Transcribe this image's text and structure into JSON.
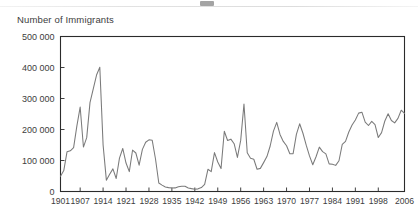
{
  "decoration": {
    "top_rule": "horizontal-rule",
    "top_glyph": "cropped-title-fragment"
  },
  "chart_data": {
    "type": "line",
    "title": "",
    "subtitle": "",
    "ylabel": "Number of Immigrants",
    "xlabel": "",
    "ylim": [
      0,
      500000
    ],
    "xlim": [
      1901,
      2006
    ],
    "grid": false,
    "legend": null,
    "y_ticks": [
      0,
      100000,
      200000,
      300000,
      400000,
      500000
    ],
    "y_tick_labels": [
      "0",
      "100 000",
      "200 000",
      "300 000",
      "400 000",
      "500 000"
    ],
    "x_ticks": [
      1901,
      1907,
      1914,
      1921,
      1928,
      1935,
      1942,
      1949,
      1956,
      1963,
      1970,
      1977,
      1984,
      1991,
      1998,
      2006
    ],
    "x_tick_labels": [
      "1901",
      "1907",
      "1914",
      "1921",
      "1928",
      "1935",
      "1942",
      "1949",
      "1956",
      "1963",
      "1970",
      "1977",
      "1984",
      "1991",
      "1998",
      "2006"
    ],
    "series": [
      {
        "name": "Immigrants",
        "color": "#7a7a7a",
        "x": [
          1901,
          1902,
          1903,
          1904,
          1905,
          1906,
          1907,
          1908,
          1909,
          1910,
          1911,
          1912,
          1913,
          1914,
          1915,
          1916,
          1917,
          1918,
          1919,
          1920,
          1921,
          1922,
          1923,
          1924,
          1925,
          1926,
          1927,
          1928,
          1929,
          1930,
          1931,
          1932,
          1933,
          1934,
          1935,
          1936,
          1937,
          1938,
          1939,
          1940,
          1941,
          1942,
          1943,
          1944,
          1945,
          1946,
          1947,
          1948,
          1949,
          1950,
          1951,
          1952,
          1953,
          1954,
          1955,
          1956,
          1957,
          1958,
          1959,
          1960,
          1961,
          1962,
          1963,
          1964,
          1965,
          1966,
          1967,
          1968,
          1969,
          1970,
          1971,
          1972,
          1973,
          1974,
          1975,
          1976,
          1977,
          1978,
          1979,
          1980,
          1981,
          1982,
          1983,
          1984,
          1985,
          1986,
          1987,
          1988,
          1989,
          1990,
          1991,
          1992,
          1993,
          1994,
          1995,
          1996,
          1997,
          1998,
          1999,
          2000,
          2001,
          2002,
          2003,
          2004,
          2005,
          2006
        ],
        "values": [
          49149,
          67379,
          128364,
          131252,
          141465,
          211653,
          272409,
          143326,
          173694,
          286839,
          331288,
          375756,
          400870,
          150484,
          36665,
          55914,
          72910,
          41845,
          107698,
          138824,
          91728,
          64224,
          133729,
          124164,
          84907,
          135982,
          158886,
          166783,
          164993,
          104806,
          27530,
          20591,
          14382,
          12476,
          11277,
          11643,
          15101,
          17244,
          16994,
          11324,
          9329,
          7576,
          8504,
          12801,
          22722,
          71719,
          64127,
          125414,
          95217,
          73912,
          194391,
          164498,
          168868,
          154227,
          109946,
          164857,
          282164,
          124851,
          106928,
          104111,
          71689,
          74586,
          93151,
          112606,
          146758,
          194743,
          222876,
          183974,
          161531,
          147713,
          121900,
          122006,
          184200,
          218465,
          187881,
          149429,
          114914,
          86313,
          112096,
          143117,
          128618,
          121147,
          89157,
          88239,
          84302,
          99219,
          152098,
          161584,
          192001,
          214230,
          230781,
          252842,
          255819,
          223875,
          212859,
          226071,
          216014,
          174195,
          189950,
          227458,
          250638,
          229048,
          221349,
          235823,
          262239,
          251643
        ]
      }
    ],
    "annotations": [
      {
        "label": "peak 1913",
        "value": 400870
      },
      {
        "label": "peak 1957",
        "value": 282164
      },
      {
        "label": "trough 1942",
        "value": 7576
      }
    ]
  }
}
